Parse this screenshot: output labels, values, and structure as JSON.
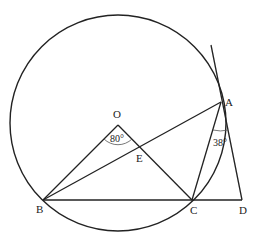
{
  "figure": {
    "type": "geometry",
    "stroke_color": "#222222",
    "background": "#ffffff"
  },
  "points": {
    "O": {
      "label": "O",
      "x": 118,
      "y": 125
    },
    "A": {
      "label": "A",
      "x": 221,
      "y": 102
    },
    "B": {
      "label": "B",
      "x": 43,
      "y": 200
    },
    "C": {
      "label": "C",
      "x": 192,
      "y": 200
    },
    "D": {
      "label": "D",
      "x": 242,
      "y": 200
    },
    "E": {
      "label": "E",
      "x": 142,
      "y": 148
    }
  },
  "circle": {
    "center": "O",
    "cx": 118,
    "cy": 123,
    "r": 108
  },
  "segments": [
    [
      "O",
      "B"
    ],
    [
      "O",
      "C"
    ],
    [
      "A",
      "B"
    ],
    [
      "A",
      "C"
    ],
    [
      "B",
      "D"
    ],
    [
      "A",
      "D"
    ]
  ],
  "tangent": {
    "at": "A",
    "through": "D",
    "extends_above_to": {
      "x": 211,
      "y": 45
    }
  },
  "angles": [
    {
      "vertex": "O",
      "between": [
        "B",
        "C"
      ],
      "label": "80°"
    },
    {
      "vertex": "A",
      "between": [
        "C",
        "D"
      ],
      "label": "38°"
    }
  ]
}
